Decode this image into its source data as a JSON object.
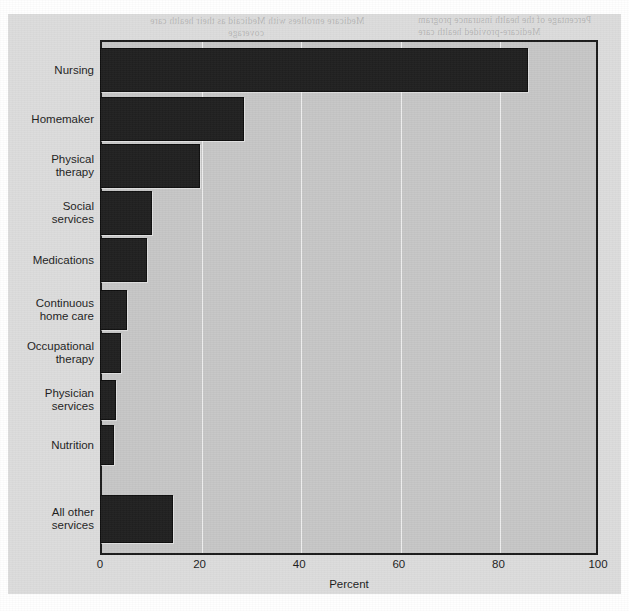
{
  "chart_data": {
    "type": "bar",
    "orientation": "horizontal",
    "title": "",
    "xlabel": "Percent",
    "ylabel": "",
    "xlim": [
      0,
      100
    ],
    "xticks": [
      0,
      20,
      40,
      60,
      80,
      100
    ],
    "grid": true,
    "legend": null,
    "categories": [
      "Nursing",
      "Homemaker",
      "Physical\ntherapy",
      "Social\nservices",
      "Medications",
      "Continuous\nhome care",
      "Occupational\ntherapy",
      "Physician\nservices",
      "Nutrition",
      "All other\nservices"
    ],
    "values": [
      86,
      29,
      20,
      10.5,
      9.5,
      5.4,
      4.2,
      3.2,
      2.8,
      14.6
    ],
    "series": [
      {
        "name": "Percent",
        "values": [
          86,
          29,
          20,
          10.5,
          9.5,
          5.4,
          4.2,
          3.2,
          2.8,
          14.6
        ]
      }
    ]
  },
  "axis": {
    "tick_labels": [
      "0",
      "20",
      "40",
      "60",
      "80",
      "100"
    ],
    "x_title": "Percent"
  },
  "colors": {
    "bar_fill": "#202020",
    "bar_edge": "#0d0d0d",
    "plot_background": "#c6c6c6",
    "page_background": "#dcdcdc",
    "gridline": "#f5f5f5",
    "text": "#1c1c1c"
  },
  "artifacts": {
    "note": "faint mirrored show-through text from reverse of page",
    "bleed_text": [
      "Medicare enrollees with Medicaid as their health care",
      "coverage",
      "Percentage of the health insurance program",
      "Medicare-provided health care"
    ]
  }
}
